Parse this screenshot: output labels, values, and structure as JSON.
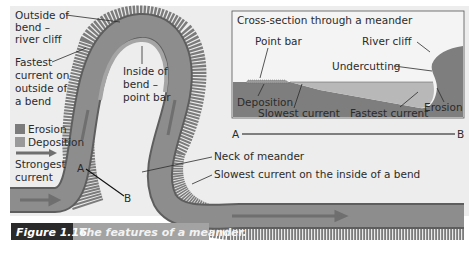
{
  "figure": {
    "caption_number": "Figure 1.16",
    "caption_text": "The features of a meander.",
    "colors": {
      "background": "#ededed",
      "river_fill": "#8a8a8a",
      "river_edge": "#5e5e5e",
      "erosion": "#7c7c7c",
      "deposition": "#9a9a9a",
      "arrow": "#6f6f6f",
      "caption_number_bg": "#2a2a2a",
      "caption_text_bg": "#a3a3a3"
    }
  },
  "plan_view": {
    "labels": {
      "outside_bend_1": "Outside of",
      "outside_bend_2": "bend –",
      "outside_bend_3": "river cliff",
      "fastest_1": "Fastest",
      "fastest_2": "current on",
      "fastest_3": "outside of",
      "fastest_4": "a bend",
      "inside_bend_1": "Inside of",
      "inside_bend_2": "bend –",
      "inside_bend_3": "point bar",
      "neck": "Neck of meander",
      "slowest_inside": "Slowest current on the inside of a bend",
      "point_a": "A",
      "point_b": "B"
    },
    "legend": {
      "erosion": "Erosion",
      "deposition": "Deposition",
      "strongest_1": "Strongest",
      "strongest_2": "current"
    }
  },
  "cross_section": {
    "title": "Cross-section through a meander",
    "labels": {
      "point_bar": "Point bar",
      "river_cliff": "River cliff",
      "undercutting": "Undercutting",
      "deposition": "Deposition",
      "slowest_current": "Slowest current",
      "fastest_current": "Fastest current",
      "erosion": "Erosion"
    },
    "axis": {
      "start": "A",
      "end": "B"
    }
  }
}
